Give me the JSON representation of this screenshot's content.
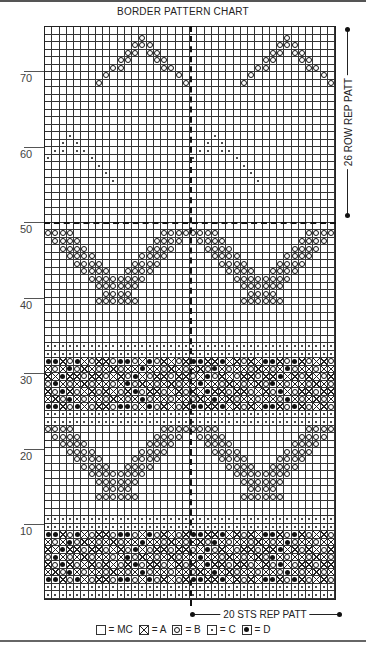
{
  "title": "BORDER PATTERN CHART",
  "grid": {
    "columns": 40,
    "rows": 76
  },
  "row_labels": [
    {
      "label": "70",
      "row": 70
    },
    {
      "label": "60",
      "row": 60
    },
    {
      "label": "50",
      "row": 50
    },
    {
      "label": "40",
      "row": 40
    },
    {
      "label": "30",
      "row": 30
    },
    {
      "label": "20",
      "row": 20
    },
    {
      "label": "10",
      "row": 10
    }
  ],
  "row_repeat_label": "26 ROW REP PATT",
  "stitch_repeat_label": "20 STS REP PATT",
  "legend": [
    {
      "symbol": "MC",
      "label": "= MC",
      "class": ""
    },
    {
      "symbol": "A",
      "label": "= A",
      "class": "a"
    },
    {
      "symbol": "B",
      "label": "= B",
      "class": "b"
    },
    {
      "symbol": "C",
      "label": "= C",
      "class": "c"
    },
    {
      "symbol": "D",
      "label": "= D",
      "class": "d"
    }
  ],
  "motifs": {
    "dot_rows": [
      1,
      2,
      10,
      11,
      24,
      25,
      33,
      34
    ],
    "band_rows": [
      [
        3,
        9
      ],
      [
        26,
        32
      ]
    ],
    "zigzag_ranges": [
      [
        12,
        23
      ],
      [
        35,
        49
      ]
    ],
    "small_motif_C_rows": [
      56,
      62
    ],
    "small_motif_B_rows": [
      69,
      75
    ]
  }
}
